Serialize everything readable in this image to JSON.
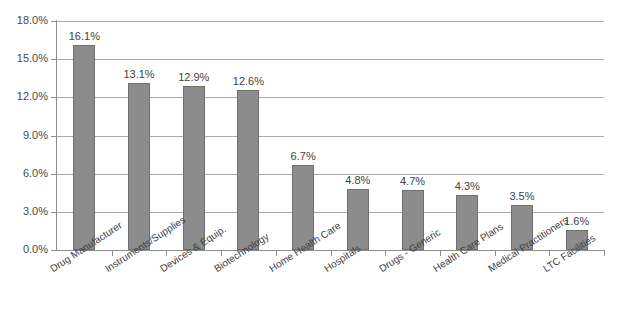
{
  "chart_data": {
    "type": "bar",
    "title": "",
    "subtitle": "",
    "xlabel": "",
    "ylabel": "",
    "ylim": [
      0,
      18
    ],
    "ytick_labels": [
      "18.0%",
      "15.0%",
      "12.0%",
      "9.0%",
      "6.0%",
      "3.0%",
      "0.0%"
    ],
    "ytick_values": [
      18,
      15,
      12,
      9,
      6,
      3,
      0
    ],
    "grid": true,
    "legend": "none",
    "categories": [
      "Drug Manufacturer",
      "Instruments/Supplies",
      "Devices & Equip.",
      "Biotechnology",
      "Home Health Care",
      "Hospitals",
      "Drugs - Generic",
      "Health Care Plans",
      "Medical Practitioners",
      "LTC Facilities"
    ],
    "values": [
      16.1,
      13.1,
      12.9,
      12.6,
      6.7,
      4.8,
      4.7,
      4.3,
      3.5,
      1.6
    ],
    "data_labels": [
      "16.1%",
      "13.1%",
      "12.9%",
      "12.6%",
      "6.7%",
      "4.8%",
      "4.7%",
      "4.3%",
      "3.5%",
      "1.6%"
    ],
    "colors": {
      "bar_fill": "#8c8c8c",
      "bar_border": "#6f6f6f",
      "gridline": "#a9a9a9",
      "axis": "#8f8f8f",
      "text": "#3f3f3f",
      "background": "#ffffff"
    }
  }
}
